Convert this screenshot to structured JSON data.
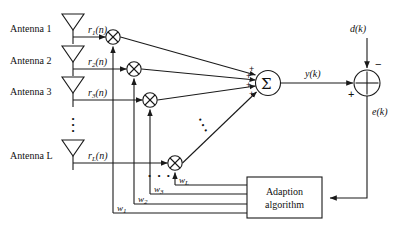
{
  "figure": {
    "type": "signal-flow-diagram",
    "stroke_color": "#1a1a1a",
    "background_color": "#ffffff"
  },
  "antennas": [
    {
      "label": "Antenna 1",
      "signal": "r",
      "signal_sub": "1",
      "signal_arg": "(n)"
    },
    {
      "label": "Antenna 2",
      "signal": "r",
      "signal_sub": "2",
      "signal_arg": "(n)"
    },
    {
      "label": "Antenna 3",
      "signal": "r",
      "signal_sub": "3",
      "signal_arg": "(n)"
    },
    {
      "label": "Antenna L",
      "signal": "r",
      "signal_sub": "L",
      "signal_arg": "(n)"
    }
  ],
  "weights": [
    {
      "label": "w",
      "sub": "1"
    },
    {
      "label": "w",
      "sub": "2"
    },
    {
      "label": "w",
      "sub": "3"
    },
    {
      "label": "w",
      "sub": "L"
    }
  ],
  "nodes": {
    "summation_symbol": "Σ",
    "summation_input_sign": "+",
    "error_adder_desired_sign": "−",
    "error_adder_output_sign": "+"
  },
  "signals": {
    "output": "y(k)",
    "desired": "d(k)",
    "error": "e(k)"
  },
  "block": {
    "line1": "Adaption",
    "line2": "algorithm"
  },
  "ellipsis": {
    "vertical": "⋮",
    "horizontal": "• • •"
  }
}
